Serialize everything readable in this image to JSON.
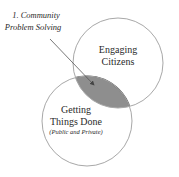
{
  "diagram": {
    "type": "venn",
    "circles": [
      {
        "id": "engaging-citizens",
        "lines": [
          "Engaging",
          "Citizens"
        ]
      },
      {
        "id": "getting-things-done",
        "lines": [
          "Getting",
          "Things Done"
        ],
        "sublabel": "(Public and Private)"
      }
    ],
    "overlap": {
      "lines": [
        "1. Community",
        "Problem Solving"
      ]
    },
    "colors": {
      "outline": "#a8a8a8",
      "overlap_fill": "#8e8e8e",
      "overlap_stroke": "#555555",
      "text": "#2a2a2a",
      "arrow": "#555555"
    }
  }
}
